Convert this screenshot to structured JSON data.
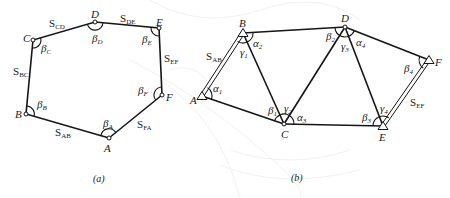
{
  "figure_a": {
    "caption": "(a)",
    "type": "closed traverse polygon",
    "points": [
      {
        "name": "A",
        "x": 109,
        "y": 138
      },
      {
        "name": "B",
        "x": 26,
        "y": 114
      },
      {
        "name": "C",
        "x": 33,
        "y": 40
      },
      {
        "name": "D",
        "x": 95,
        "y": 22
      },
      {
        "name": "E",
        "x": 159,
        "y": 28
      },
      {
        "name": "F",
        "x": 162,
        "y": 95
      }
    ],
    "sides": [
      {
        "main": "S",
        "sub": "AB"
      },
      {
        "main": "S",
        "sub": "BC"
      },
      {
        "main": "S",
        "sub": "CD"
      },
      {
        "main": "S",
        "sub": "DE"
      },
      {
        "main": "S",
        "sub": "EF"
      },
      {
        "main": "S",
        "sub": "FA"
      }
    ],
    "angles": [
      {
        "main": "β",
        "sub": "A"
      },
      {
        "main": "β",
        "sub": "B"
      },
      {
        "main": "β",
        "sub": "C"
      },
      {
        "main": "β",
        "sub": "D"
      },
      {
        "main": "β",
        "sub": "E"
      },
      {
        "main": "β",
        "sub": "F"
      }
    ]
  },
  "figure_b": {
    "caption": "(b)",
    "type": "triangulation chain",
    "points": [
      {
        "name": "A",
        "x": 202,
        "y": 96,
        "marker": "triangle"
      },
      {
        "name": "B",
        "x": 243,
        "y": 33,
        "marker": "triangle"
      },
      {
        "name": "C",
        "x": 284,
        "y": 124,
        "marker": "circle"
      },
      {
        "name": "D",
        "x": 345,
        "y": 27,
        "marker": "circle"
      },
      {
        "name": "E",
        "x": 383,
        "y": 126,
        "marker": "triangle"
      },
      {
        "name": "F",
        "x": 429,
        "y": 60,
        "marker": "triangle"
      }
    ],
    "sides": [
      {
        "main": "S",
        "sub": "AB"
      },
      {
        "main": "S",
        "sub": "EF"
      }
    ],
    "angles": {
      "alpha": [
        {
          "main": "α",
          "sub": "1"
        },
        {
          "main": "α",
          "sub": "2"
        },
        {
          "main": "α",
          "sub": "3"
        },
        {
          "main": "α",
          "sub": "4"
        }
      ],
      "beta": [
        {
          "main": "β",
          "sub": "1"
        },
        {
          "main": "β",
          "sub": "2"
        },
        {
          "main": "β",
          "sub": "3"
        },
        {
          "main": "β",
          "sub": "4"
        }
      ],
      "gamma": [
        {
          "main": "γ",
          "sub": "1"
        },
        {
          "main": "γ",
          "sub": "2"
        },
        {
          "main": "γ",
          "sub": "3"
        },
        {
          "main": "γ",
          "sub": "4"
        }
      ]
    }
  },
  "colors": {
    "line": "#151515",
    "background": "#ffffff",
    "watermark": "#ececec"
  }
}
